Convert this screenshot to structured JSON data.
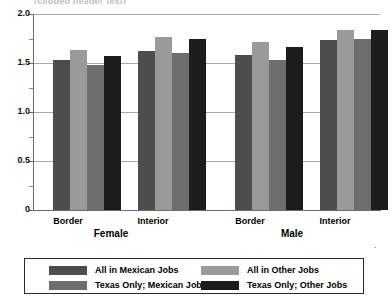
{
  "title_clipped": "(clipped header text)",
  "chart_data": {
    "type": "bar",
    "title": "",
    "xlabel": "",
    "ylabel": "",
    "ylim": [
      0,
      2.0
    ],
    "grid": true,
    "legend_position": "bottom",
    "y_ticks": [
      "0",
      "0.5",
      "1.0",
      "1.5",
      "2.0"
    ],
    "y_tick_values": [
      0,
      0.5,
      1.0,
      1.5,
      2.0
    ],
    "y_minor_tick_values": [
      0.25,
      0.75,
      1.25,
      1.75
    ],
    "categories": [
      "Border",
      "Interior",
      "Border",
      "Interior"
    ],
    "supergroups": [
      {
        "label": "Female",
        "categories": [
          "Border",
          "Interior"
        ]
      },
      {
        "label": "Male",
        "categories": [
          "Border",
          "Interior"
        ]
      }
    ],
    "series": [
      {
        "name": "All in Mexican Jobs",
        "color": "#4d4d4d",
        "values": [
          1.53,
          1.62,
          1.58,
          1.73
        ]
      },
      {
        "name": "All in Other Jobs",
        "color": "#9a9a9a",
        "values": [
          1.63,
          1.77,
          1.71,
          1.84
        ]
      },
      {
        "name": "Texas Only; Mexican Jobs",
        "color": "#6e6e6e",
        "values": [
          1.48,
          1.6,
          1.53,
          1.75
        ]
      },
      {
        "name": "Texas Only; Other Jobs",
        "color": "#1c1c1c",
        "values": [
          1.57,
          1.74,
          1.66,
          1.84
        ]
      }
    ]
  },
  "legend": {
    "items": [
      {
        "label": "All in Mexican Jobs",
        "color": "#4d4d4d"
      },
      {
        "label": "All in Other Jobs",
        "color": "#9a9a9a"
      },
      {
        "label": "Texas Only; Mexican Jobs",
        "color": "#6e6e6e"
      },
      {
        "label": "Texas Only; Other Jobs",
        "color": "#1c1c1c"
      }
    ]
  },
  "stray_mark": "."
}
